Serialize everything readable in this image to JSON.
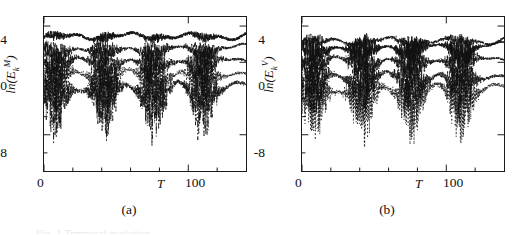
{
  "figure": {
    "panels": [
      {
        "tag": "(a)",
        "ylabel_prefix": "ln(E",
        "ylabel_sub": "k",
        "ylabel_sup": "M",
        "ylabel_suffix": ")",
        "xlabel": "T",
        "yticks": [
          "4",
          "0",
          "-8"
        ],
        "xticks": [
          "0",
          "100"
        ]
      },
      {
        "tag": "(b)",
        "ylabel_prefix": "ln(E",
        "ylabel_sub": "k",
        "ylabel_sup": "V",
        "ylabel_suffix": ")",
        "xlabel": "T",
        "yticks": [
          "4",
          "0",
          "-8"
        ],
        "xticks": [
          "0",
          "100"
        ]
      }
    ],
    "caption_remnant": "Fig. 1  Temporal evolution"
  },
  "chart_data": [
    {
      "type": "line",
      "title": "",
      "panel": "(a)",
      "xlabel": "T",
      "ylabel": "ln(E_k^M)",
      "xlim": [
        0,
        140
      ],
      "ylim": [
        -12,
        5
      ],
      "yticks": [
        4,
        0,
        -8
      ],
      "xticks": [
        0,
        100
      ],
      "xminorticks": [
        20,
        40,
        60,
        80,
        120
      ],
      "grid": false,
      "legend": "none",
      "burst_centers": [
        8,
        42,
        76,
        110
      ],
      "burst_period": 34,
      "series": [
        {
          "name": "k=1 (solid)",
          "style": "solid",
          "baseline": 2.9,
          "noise": 0.35,
          "burst_noise": 0.55,
          "burst_drop": 0.0
        },
        {
          "name": "k=2 (dashed)",
          "style": "dashed",
          "baseline": 1.6,
          "noise": 0.25,
          "burst_noise": 1.6,
          "burst_drop": 0.8
        },
        {
          "name": "k=3 (dash-dot)",
          "style": "dashdot",
          "baseline": 0.3,
          "noise": 0.3,
          "burst_noise": 2.6,
          "burst_drop": 1.6
        },
        {
          "name": "k=4 (dotted)",
          "style": "dotted",
          "baseline": -1.1,
          "noise": 0.35,
          "burst_noise": 3.2,
          "burst_drop": 2.2
        },
        {
          "name": "k=5 (dash-dot-dot)",
          "style": "dashdotdot",
          "baseline": -2.6,
          "noise": 0.4,
          "burst_noise": 4.0,
          "burst_drop": 3.0
        }
      ]
    },
    {
      "type": "line",
      "title": "",
      "panel": "(b)",
      "xlabel": "T",
      "ylabel": "ln(E_k^V)",
      "xlim": [
        0,
        140
      ],
      "ylim": [
        -12,
        5
      ],
      "yticks": [
        4,
        0,
        -8
      ],
      "xticks": [
        0,
        100
      ],
      "xminorticks": [
        20,
        40,
        60,
        80,
        120
      ],
      "grid": false,
      "legend": "none",
      "burst_centers": [
        8,
        42,
        76,
        110
      ],
      "burst_period": 34,
      "series": [
        {
          "name": "k=1 (dashed)",
          "style": "dashed",
          "baseline": 2.4,
          "noise": 0.3,
          "burst_noise": 0.9,
          "burst_drop": 0.1
        },
        {
          "name": "k=2 (solid)",
          "style": "solid",
          "baseline": 1.8,
          "noise": 0.2,
          "burst_noise": 1.8,
          "burst_drop": 1.2
        },
        {
          "name": "k=3 (dash-dot)",
          "style": "dashdot",
          "baseline": 0.4,
          "noise": 0.25,
          "burst_noise": 2.6,
          "burst_drop": 1.6
        },
        {
          "name": "k=4 (dash-dot-dot)",
          "style": "dashdotdot",
          "baseline": -1.4,
          "noise": 0.35,
          "burst_noise": 3.4,
          "burst_drop": 2.4
        },
        {
          "name": "k=5 (dotted)",
          "style": "dotted",
          "baseline": -2.8,
          "noise": 0.4,
          "burst_noise": 4.2,
          "burst_drop": 3.2
        }
      ]
    }
  ]
}
